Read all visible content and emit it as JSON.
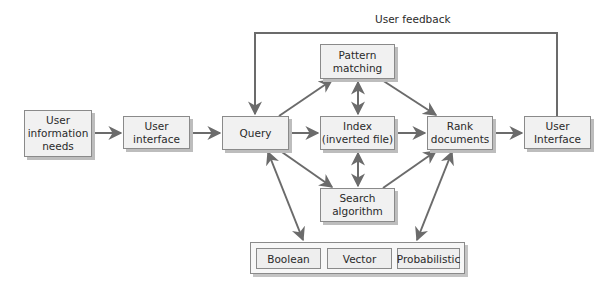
{
  "diagram": {
    "colors": {
      "box_fill": "#f1f1f1",
      "box_border": "#8a8a8a",
      "shadow": "#bdbdbd",
      "arrow": "#6b6b6b",
      "text": "#2a2a2a"
    },
    "feedback_label": "User feedback",
    "nodes": {
      "user_info_needs": "User\ninformation\nneeds",
      "user_interface_in": "User\ninterface",
      "query": "Query",
      "pattern_matching": "Pattern\nmatching",
      "index": "Index\n(inverted file)",
      "search_algorithm": "Search\nalgorithm",
      "rank_documents": "Rank\ndocuments",
      "user_interface_out": "User\nInterface"
    },
    "models": [
      "Boolean",
      "Vector",
      "Probabilistic"
    ],
    "edges": [
      {
        "from": "User information needs",
        "to": "User interface",
        "type": "arrow"
      },
      {
        "from": "User interface",
        "to": "Query",
        "type": "arrow"
      },
      {
        "from": "Query",
        "to": "Pattern matching",
        "type": "arrow"
      },
      {
        "from": "Query",
        "to": "Index (inverted file)",
        "type": "arrow"
      },
      {
        "from": "Query",
        "to": "Search algorithm",
        "type": "arrow"
      },
      {
        "from": "Pattern matching",
        "to": "Index (inverted file)",
        "type": "bidirectional"
      },
      {
        "from": "Index (inverted file)",
        "to": "Search algorithm",
        "type": "bidirectional"
      },
      {
        "from": "Pattern matching",
        "to": "Rank documents",
        "type": "arrow"
      },
      {
        "from": "Index (inverted file)",
        "to": "Rank documents",
        "type": "arrow"
      },
      {
        "from": "Search algorithm",
        "to": "Rank documents",
        "type": "arrow"
      },
      {
        "from": "Rank documents",
        "to": "User Interface",
        "type": "arrow"
      },
      {
        "from": "User Interface",
        "to": "Query",
        "type": "arrow",
        "label": "User feedback"
      },
      {
        "from": "Query",
        "to": "Models (Boolean/Vector/Probabilistic)",
        "type": "bidirectional"
      },
      {
        "from": "Rank documents",
        "to": "Models (Boolean/Vector/Probabilistic)",
        "type": "bidirectional"
      }
    ]
  }
}
